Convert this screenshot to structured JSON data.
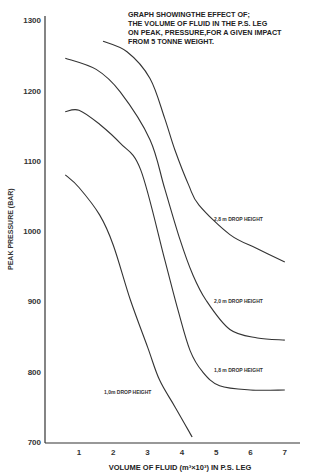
{
  "chart_data": {
    "type": "line",
    "title_lines": [
      "GRAPH SHOWINGTHE EFFECT  OF;",
      "THE VOLUME OF FLUID IN THE P.S.  LEG",
      "ON PEAK, PRESSURE,FOR A GIVEN IMPACT",
      "FROM 5 TONNE WEIGHT."
    ],
    "xlabel": "VOLUME OF FLUID (m³×10³) IN P.S. LEG",
    "ylabel": "PEAK PRESSURE (BAR)",
    "xlim": [
      0,
      7.3
    ],
    "ylim": [
      700,
      1300
    ],
    "x_ticks": [
      "1",
      "2",
      "3",
      "4",
      "5",
      "6",
      "7"
    ],
    "y_ticks": [
      "700",
      "800",
      "900",
      "1000",
      "1100",
      "1200",
      "1300"
    ],
    "grid": false,
    "legend": "inline labels",
    "series": [
      {
        "name": "2,8 m DROP HEIGHT",
        "label": "2,8 m  DROP HEIGHT",
        "x": [
          1.7,
          2.4,
          3.07,
          3.5,
          3.8,
          4.2,
          4.5,
          5.4,
          6.2,
          7.0
        ],
        "y": [
          1270,
          1255,
          1217,
          1160,
          1115,
          1065,
          1037,
          995,
          975,
          956
        ]
      },
      {
        "name": "2,0 m DROP HEIGHT",
        "label": "2,0 m  DROP HEIGHT",
        "x": [
          0.6,
          1.5,
          2.2,
          3.07,
          3.5,
          3.95,
          4.3,
          4.7,
          5.4,
          6.2,
          7.0
        ],
        "y": [
          1246,
          1230,
          1198,
          1130,
          1060,
          987,
          940,
          902,
          860,
          848,
          845
        ]
      },
      {
        "name": "1,8 m DROP HEIGHT",
        "label": "1,8 m   DROP HEIGHT",
        "x": [
          0.6,
          1.0,
          1.6,
          2.2,
          2.8,
          3.5,
          3.9,
          4.24,
          4.6,
          5.1,
          6.0,
          7.0
        ],
        "y": [
          1170,
          1172,
          1152,
          1125,
          1087,
          959,
          885,
          830,
          800,
          780,
          774,
          774
        ]
      },
      {
        "name": "1,0 m DROP HEIGHT",
        "label": "1,0m DROP HEIGHT",
        "x": [
          0.6,
          1.0,
          1.6,
          2.0,
          2.5,
          3.0,
          3.35,
          3.8,
          4.3
        ],
        "y": [
          1080,
          1062,
          1023,
          980,
          902,
          835,
          788,
          750,
          707
        ]
      }
    ]
  }
}
